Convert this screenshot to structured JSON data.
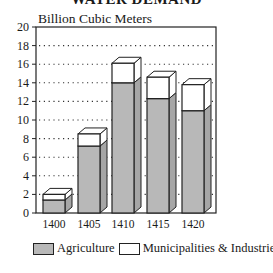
{
  "chart_data": {
    "type": "bar",
    "stacked": true,
    "style": "3d",
    "title": "WATER DEMAND",
    "ylabel": "Billion Cubic Meters",
    "xlabel": "",
    "categories": [
      "1400",
      "1405",
      "1410",
      "1415",
      "1420"
    ],
    "series": [
      {
        "name": "Agriculture",
        "color": "#b8b8b8",
        "values": [
          1.4,
          7.2,
          14.0,
          12.3,
          11.0
        ]
      },
      {
        "name": "Municipalities & Industries",
        "color": "#ffffff",
        "values": [
          0.6,
          1.3,
          2.1,
          2.3,
          2.8
        ]
      }
    ],
    "totals": [
      2.0,
      8.5,
      16.1,
      14.6,
      13.8
    ],
    "ylim": [
      0,
      20
    ],
    "yticks": [
      0,
      2,
      4,
      6,
      8,
      10,
      12,
      14,
      16,
      18,
      20
    ],
    "grid": "dotted horizontal",
    "legend_position": "bottom"
  },
  "title": "WATER DEMAND",
  "ylabel": "Billion Cubic Meters",
  "yticks": [
    "0",
    "2",
    "4",
    "6",
    "8",
    "10",
    "12",
    "14",
    "16",
    "18",
    "20"
  ],
  "xticks": [
    "1400",
    "1405",
    "1410",
    "1415",
    "1420"
  ],
  "legend": {
    "agriculture": "Agriculture",
    "municipal": "Municipalities & Industries"
  }
}
